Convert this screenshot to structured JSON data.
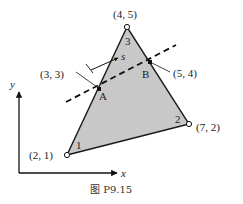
{
  "figure": {
    "caption": "图 P9.15",
    "fill_color": "#c8c8c8",
    "stroke_color": "#1a1a1a"
  },
  "axes": {
    "x_label": "x",
    "y_label": "y"
  },
  "nodes": [
    {
      "id": "1",
      "coord_label": "(2, 1)"
    },
    {
      "id": "2",
      "coord_label": "(7, 2)"
    },
    {
      "id": "3",
      "coord_label": "(4, 5)"
    }
  ],
  "points": [
    {
      "name": "A",
      "coord_label": "(3, 3)"
    },
    {
      "name": "B",
      "coord_label": "(5, 4)"
    }
  ],
  "local_axis": {
    "label": "s"
  }
}
